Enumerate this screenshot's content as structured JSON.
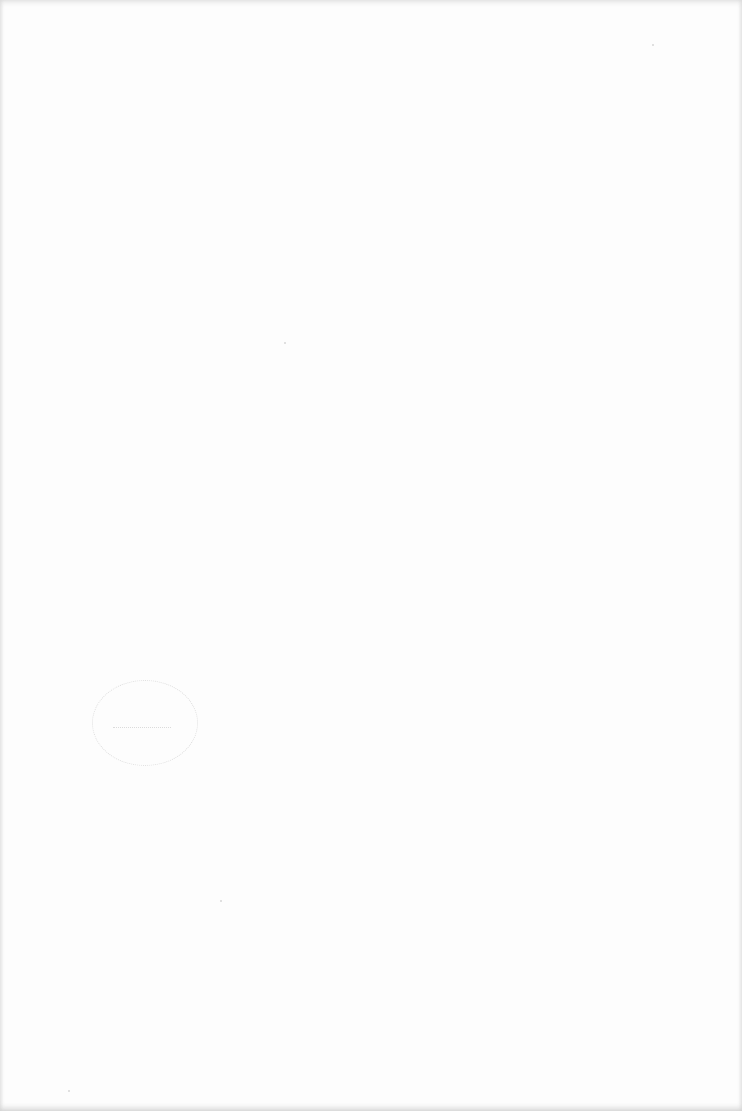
{
  "document": {
    "type": "scanned-page",
    "content": "blank",
    "stamp": {
      "shape": "circle",
      "text": "",
      "color": "#d4d4d4"
    },
    "background_color": "#fdfdfd",
    "edge_shadow_color": "#cfcfcf"
  }
}
